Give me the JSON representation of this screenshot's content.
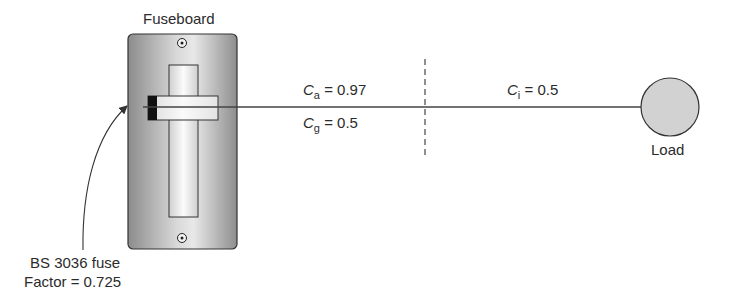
{
  "fuseboard": {
    "title": "Fuseboard"
  },
  "fuse": {
    "line1": "BS 3036 fuse",
    "line2": "Factor = 0.725"
  },
  "factors": {
    "ca": {
      "symbol": "C",
      "subscript": "a",
      "equals": "= 0.97"
    },
    "cg": {
      "symbol": "C",
      "subscript": "g",
      "equals": "= 0.5"
    },
    "ci": {
      "symbol": "C",
      "subscript": "i",
      "equals": "= 0.5"
    }
  },
  "load": {
    "label": "Load"
  },
  "colors": {
    "board_dark": "#8a8a8a",
    "board_light": "#e6e6e6",
    "load_fill": "#d2d2d2",
    "line": "#444444",
    "fuse_block": "#111111"
  }
}
